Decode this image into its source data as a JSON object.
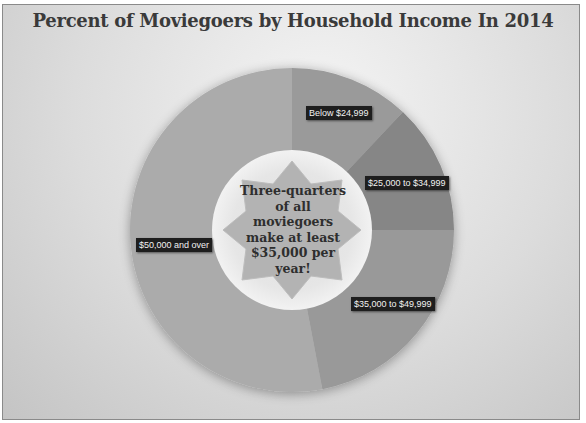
{
  "chart_data": {
    "type": "pie",
    "variant": "donut",
    "title": "Percent of Moviegoers by Household Income In 2014",
    "categories": [
      "Below $24,999",
      "$25,000 to $34,999",
      "$35,000 to $49,999",
      "$50,000 and over"
    ],
    "values": [
      12,
      13,
      22,
      53
    ],
    "units": "percent (estimated from slice angles)",
    "colors": [
      "#9a9a9a",
      "#868686",
      "#999999",
      "#ababab"
    ],
    "center_annotation": "Three-quarters of all moviegoers make at least $35,000 per year!",
    "legend": "none (data labels on slices)"
  },
  "labels": {
    "s0": "Below $24,999",
    "s1": "$25,000 to $34,999",
    "s2": "$35,000 to $49,999",
    "s3": "$50,000 and over"
  },
  "title": "Percent of Moviegoers by Household Income In 2014",
  "center_text": "Three-quarters of all moviegoers make at least $35,000 per year!"
}
